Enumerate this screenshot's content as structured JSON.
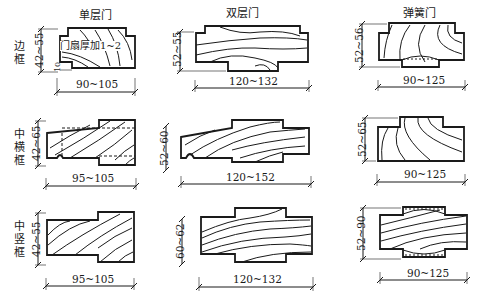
{
  "columns": [
    {
      "title": "单层门"
    },
    {
      "title": "双层门"
    },
    {
      "title": "弹簧门"
    }
  ],
  "rows": [
    {
      "label": "边框"
    },
    {
      "label": "中横框"
    },
    {
      "label": "中竖框"
    }
  ],
  "cells": [
    [
      {
        "height_dim": "42~55",
        "width_dim": "90~105",
        "note": "门扇厚加1~2",
        "small_dim": "10"
      },
      {
        "height_dim": "52~55",
        "width_dim": "120~132"
      },
      {
        "height_dim": "52~56",
        "width_dim": "90~125"
      }
    ],
    [
      {
        "height_dim": "42~65",
        "width_dim": "95~105"
      },
      {
        "height_dim": "52~60",
        "width_dim": "120~152"
      },
      {
        "height_dim": "52~65",
        "width_dim": "90~125"
      }
    ],
    [
      {
        "height_dim": "42~55",
        "width_dim": "95~105"
      },
      {
        "height_dim": "60~62",
        "width_dim": "120~132"
      },
      {
        "height_dim": "52~90",
        "width_dim": "90~125"
      }
    ]
  ],
  "colors": {
    "line": "#1a1a1a",
    "background": "#ffffff"
  }
}
